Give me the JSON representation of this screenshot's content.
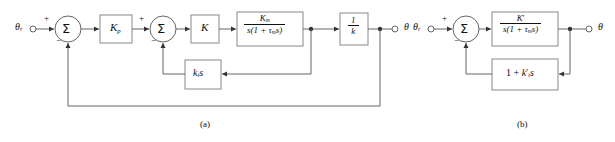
{
  "figure": {
    "caption_a": "(a)",
    "caption_b": "(b)"
  },
  "diagram_a": {
    "input_label": "θ",
    "input_sub": "r",
    "output_label": "θ",
    "sum1": {
      "symbol": "Σ",
      "plus": "+",
      "minus": "−"
    },
    "sum2": {
      "symbol": "Σ",
      "plus": "+",
      "minus": "−"
    },
    "block_kp": {
      "main": "K",
      "sub": "p"
    },
    "block_k": {
      "main": "K"
    },
    "block_plant": {
      "numerator_main": "K",
      "numerator_sub": "m",
      "denominator_pre": "s(1 + ",
      "denominator_tau": "τ",
      "denominator_tau_sub": "m",
      "denominator_post": "s)"
    },
    "block_gain": {
      "numerator": "1",
      "denominator": "k"
    },
    "block_tach": {
      "main": "k",
      "sub": "t",
      "post": "s"
    }
  },
  "diagram_b": {
    "input_label": "θ",
    "input_sub": "r",
    "output_label": "θ",
    "sum1": {
      "symbol": "Σ",
      "plus": "+",
      "minus": "−"
    },
    "block_plant": {
      "numerator_main": "K",
      "numerator_prime": "′",
      "denominator_pre": "s(1 + ",
      "denominator_tau": "τ",
      "denominator_tau_sub": "m",
      "denominator_post": "s)"
    },
    "block_feedback": {
      "pre": "1 + ",
      "main": "k",
      "prime": "′",
      "sub": "t",
      "post": "s"
    }
  },
  "colors": {
    "line": "#555555",
    "box_border": "#888888",
    "text": "#111111",
    "background": "#ffffff"
  }
}
